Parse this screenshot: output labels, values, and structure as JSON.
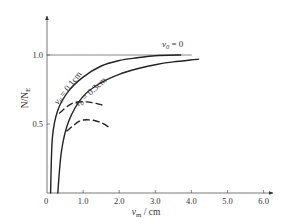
{
  "chart_data": {
    "type": "line",
    "title": "",
    "xlabel": "v_m / cm",
    "ylabel": "N/N_E",
    "xlim": [
      0,
      6.0
    ],
    "ylim": [
      0,
      1.0
    ],
    "grid": false,
    "legend": "inline labels on curves",
    "x_ticks": [
      "0",
      "1.0",
      "2.0",
      "3.0",
      "4.0",
      "5.0",
      "6.0"
    ],
    "y_ticks": [
      "0.5",
      "1.0"
    ],
    "series": [
      {
        "name": "v0 = 0",
        "style": "thin solid",
        "x": [
          0,
          4.0
        ],
        "y": [
          1.0,
          1.0
        ]
      },
      {
        "name": "v0 = 0.1cm",
        "style": "solid",
        "x": [
          0.1,
          0.15,
          0.3,
          0.6,
          1.0,
          1.5,
          2.0,
          2.5,
          3.0,
          3.7
        ],
        "y": [
          0.0,
          0.4,
          0.6,
          0.74,
          0.84,
          0.92,
          0.96,
          0.98,
          0.995,
          1.0
        ]
      },
      {
        "name": "v0 = 0.3cm",
        "style": "solid",
        "x": [
          0.3,
          0.4,
          0.6,
          1.0,
          1.5,
          2.0,
          2.5,
          3.0,
          3.5,
          4.2
        ],
        "y": [
          0.0,
          0.3,
          0.52,
          0.7,
          0.8,
          0.86,
          0.9,
          0.93,
          0.95,
          0.97
        ]
      },
      {
        "name": "dashed (v0 = 0.1cm, upper)",
        "style": "dashed",
        "x": [
          0.35,
          0.7,
          1.1,
          1.5,
          1.6
        ],
        "y": [
          0.58,
          0.65,
          0.66,
          0.64,
          0.62
        ]
      },
      {
        "name": "dashed (v0 = 0.3cm, lower)",
        "style": "dashed",
        "x": [
          0.55,
          0.9,
          1.2,
          1.5,
          1.75
        ],
        "y": [
          0.45,
          0.52,
          0.53,
          0.51,
          0.47
        ]
      }
    ],
    "annotations": [
      "v0 = 0",
      "v0 = 0.1cm",
      "v0 = 0.3cm"
    ]
  },
  "labels": {
    "xlabel_main": "v",
    "xlabel_sub": "m",
    "xlabel_unit": " / cm",
    "ylabel_main": "N/N",
    "ylabel_sub": "E",
    "curve_v0_0": "v",
    "curve_v0_0_sub": "0",
    "curve_v0_0_val": " = 0",
    "curve_v01_main": "v",
    "curve_v01_sub": "0",
    "curve_v01_val": " = 0.1cm",
    "curve_v03_main": "v",
    "curve_v03_sub": "0",
    "curve_v03_val": " = 0.3cm"
  }
}
